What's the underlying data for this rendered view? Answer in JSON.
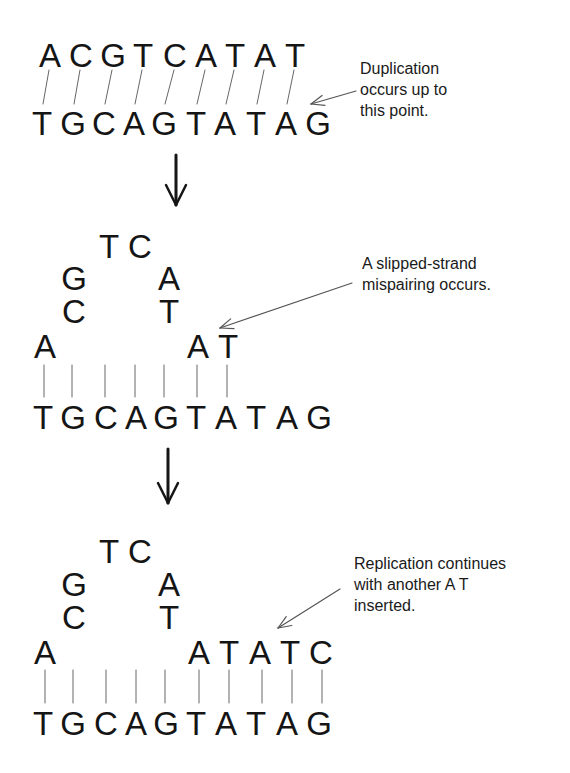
{
  "stages": [
    {
      "id": "stage-1",
      "top_strand": [
        "A",
        "C",
        "G",
        "T",
        "C",
        "A",
        "T",
        "A",
        "T"
      ],
      "top_x": [
        50,
        81,
        113,
        143,
        175,
        206,
        235,
        265,
        295
      ],
      "top_y": 39,
      "bottom_strand": [
        "T",
        "G",
        "C",
        "A",
        "G",
        "T",
        "A",
        "T",
        "A",
        "G"
      ],
      "bottom_x": [
        42,
        73,
        104,
        134,
        164,
        196,
        225,
        256,
        286,
        318
      ],
      "bottom_y": 107,
      "pairs": [
        {
          "x1": 50,
          "x2": 42
        },
        {
          "x1": 81,
          "x2": 73
        },
        {
          "x1": 113,
          "x2": 104
        },
        {
          "x1": 143,
          "x2": 134
        },
        {
          "x1": 175,
          "x2": 164
        },
        {
          "x1": 206,
          "x2": 196
        },
        {
          "x1": 235,
          "x2": 225
        },
        {
          "x1": 265,
          "x2": 256
        },
        {
          "x1": 295,
          "x2": 286
        }
      ],
      "bar_y": [
        70,
        104
      ],
      "annotation": {
        "lines": [
          "Duplication",
          "occurs up to",
          "this point."
        ],
        "x": 360,
        "y": 58,
        "arrow": {
          "from": [
            356,
            91
          ],
          "to": [
            311,
            104
          ]
        }
      }
    },
    {
      "id": "stage-2",
      "loop": [
        {
          "base": "T",
          "x": 109,
          "y": 230
        },
        {
          "base": "C",
          "x": 140,
          "y": 230
        },
        {
          "base": "G",
          "x": 74,
          "y": 262
        },
        {
          "base": "A",
          "x": 169,
          "y": 262
        },
        {
          "base": "C",
          "x": 74,
          "y": 295
        },
        {
          "base": "T",
          "x": 169,
          "y": 295
        }
      ],
      "top_strand": [
        {
          "base": "A",
          "x": 45,
          "y": 330
        },
        {
          "base": "A",
          "x": 198,
          "y": 330
        },
        {
          "base": "T",
          "x": 228,
          "y": 330
        }
      ],
      "bottom_strand": [
        "T",
        "G",
        "C",
        "A",
        "G",
        "T",
        "A",
        "T",
        "A",
        "G"
      ],
      "bottom_x": [
        43,
        73,
        106,
        136,
        166,
        196,
        226,
        256,
        287,
        319
      ],
      "bottom_y": 401,
      "pair_x": [
        44,
        72,
        105,
        135,
        164,
        197,
        227
      ],
      "bar_y": [
        365,
        397
      ],
      "annotation": {
        "lines": [
          "A slipped-strand",
          "mispairing occurs."
        ],
        "x": 362,
        "y": 253,
        "arrow": {
          "from": [
            352,
            283
          ],
          "to": [
            220,
            328
          ]
        }
      }
    },
    {
      "id": "stage-3",
      "loop": [
        {
          "base": "T",
          "x": 109,
          "y": 535
        },
        {
          "base": "C",
          "x": 140,
          "y": 535
        },
        {
          "base": "G",
          "x": 74,
          "y": 568
        },
        {
          "base": "A",
          "x": 169,
          "y": 568
        },
        {
          "base": "C",
          "x": 74,
          "y": 601
        },
        {
          "base": "T",
          "x": 169,
          "y": 601
        }
      ],
      "top_strand": [
        {
          "base": "A",
          "x": 45,
          "y": 636
        },
        {
          "base": "A",
          "x": 199,
          "y": 636
        },
        {
          "base": "T",
          "x": 229,
          "y": 636
        },
        {
          "base": "A",
          "x": 260,
          "y": 636
        },
        {
          "base": "T",
          "x": 290,
          "y": 636
        },
        {
          "base": "C",
          "x": 321,
          "y": 636
        }
      ],
      "bottom_strand": [
        "T",
        "G",
        "C",
        "A",
        "G",
        "T",
        "A",
        "T",
        "A",
        "G"
      ],
      "bottom_x": [
        43,
        73,
        106,
        136,
        166,
        196,
        226,
        256,
        287,
        319
      ],
      "bottom_y": 707,
      "pair_x": [
        45,
        73,
        106,
        136,
        165,
        199,
        229,
        262,
        292,
        322
      ],
      "bar_y": [
        670,
        703
      ],
      "annotation": {
        "lines": [
          "Replication continues",
          "with another A T",
          "inserted."
        ],
        "x": 354,
        "y": 553,
        "arrow": {
          "from": [
            340,
            589
          ],
          "to": [
            278,
            628
          ]
        }
      }
    }
  ],
  "transition_arrows": [
    {
      "x": 176,
      "y1": 155,
      "y2": 205
    },
    {
      "x": 168,
      "y1": 449,
      "y2": 503
    }
  ],
  "colors": {
    "text": "#151515",
    "pair_line": "#666666",
    "pointer": "#555555",
    "background": "#ffffff"
  }
}
